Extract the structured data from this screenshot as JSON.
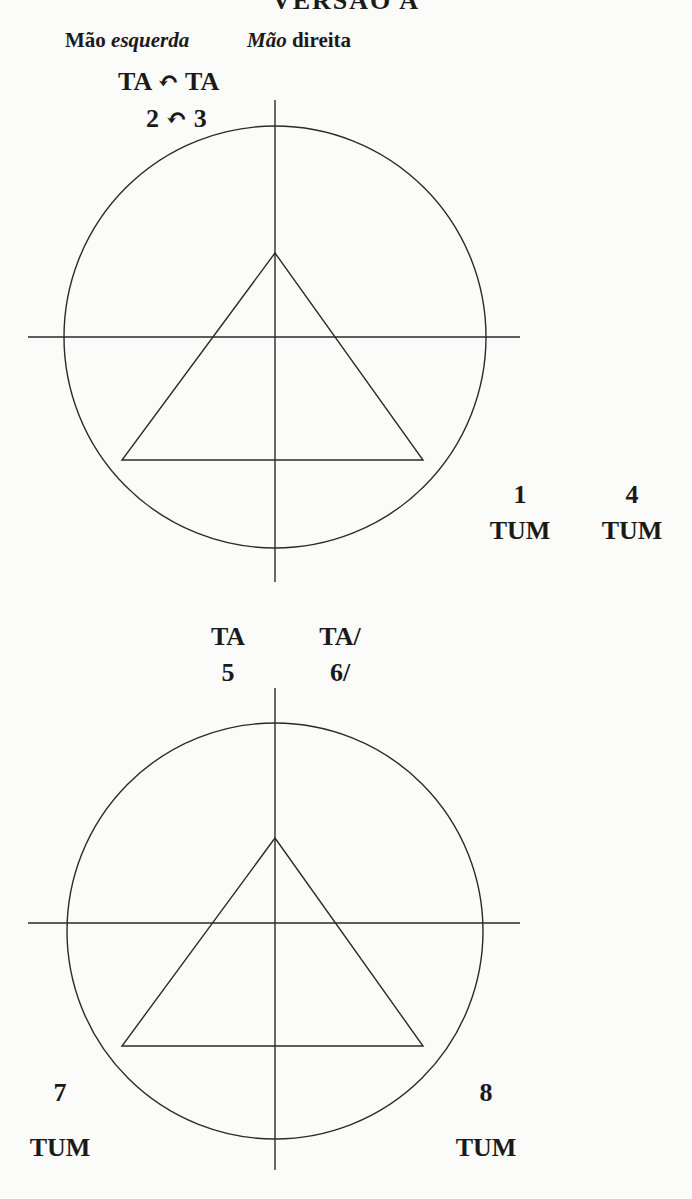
{
  "header": {
    "title_partial": "VERSÃO A",
    "left_hand": {
      "plain": "Mão ",
      "italic": "esquerda"
    },
    "right_hand": {
      "italic": "Mão",
      "plain": " direita"
    }
  },
  "diagram_top": {
    "syllables": "TA ↶ TA",
    "beats": "2 ↶ 3",
    "right_labels": [
      {
        "num": "1",
        "sound": "TUM"
      },
      {
        "num": "4",
        "sound": "TUM"
      }
    ]
  },
  "diagram_bottom": {
    "top_labels": [
      {
        "sound": "TA",
        "num": "5"
      },
      {
        "sound": "TA/",
        "num": "6/"
      }
    ],
    "bottom_labels": [
      {
        "num": "7",
        "sound": "TUM"
      },
      {
        "num": "8",
        "sound": "TUM"
      }
    ]
  },
  "colors": {
    "background": "#fbfbf9",
    "ink": "#1a1a1a",
    "line": "#2a2a2a"
  }
}
